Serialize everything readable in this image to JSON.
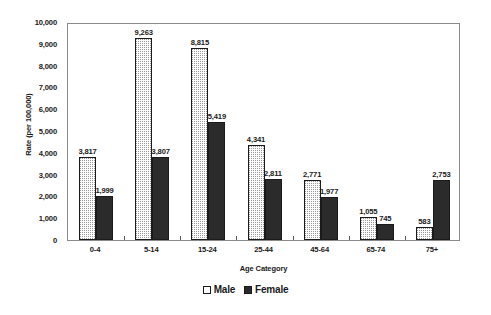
{
  "chart_data": {
    "type": "bar",
    "title": "",
    "xlabel": "Age Category",
    "ylabel": "Rate (per 100,000)",
    "ylim": [
      0,
      10000
    ],
    "ytick_step": 1000,
    "grid": false,
    "legend_position": "bottom",
    "categories": [
      "0-4",
      "5-14",
      "15-24",
      "25-44",
      "45-64",
      "65-74",
      "75+"
    ],
    "ytick_labels": [
      "0",
      "1,000",
      "2,000",
      "3,000",
      "4,000",
      "5,000",
      "6,000",
      "7,000",
      "8,000",
      "9,000",
      "10,000"
    ],
    "series": [
      {
        "name": "Male",
        "values": [
          3817,
          9263,
          8815,
          4341,
          2771,
          1055,
          583
        ],
        "labels": [
          "3,817",
          "9,263",
          "8,815",
          "4,341",
          "2,771",
          "1,055",
          "583"
        ],
        "fill": "dotted-light",
        "color": "#fbfbfb",
        "border_color": "#1a1a1a"
      },
      {
        "name": "Female",
        "values": [
          1999,
          3807,
          5419,
          2811,
          1977,
          745,
          2753
        ],
        "labels": [
          "1,999",
          "3,807",
          "5,419",
          "2,811",
          "1,977",
          "745",
          "2,753"
        ],
        "fill": "solid-dark",
        "color": "#2b2b2b",
        "border_color": "#1a1a1a"
      }
    ]
  },
  "legend": {
    "items": [
      {
        "label": "Male",
        "swatch": "open-square"
      },
      {
        "label": "Female",
        "swatch": "filled-square"
      }
    ]
  },
  "axes": {
    "y_title": "Rate (per 100,000)",
    "x_title": "Age Category"
  }
}
